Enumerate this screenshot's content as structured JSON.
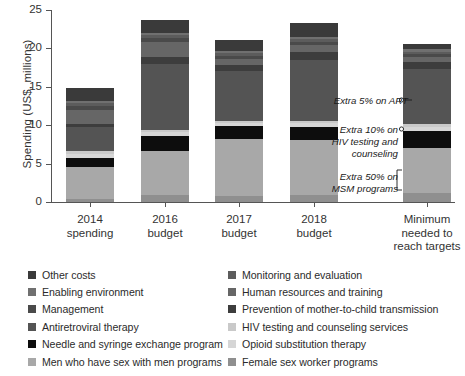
{
  "chart_data": {
    "type": "bar",
    "subtype": "stacked-bar",
    "title": "",
    "xlabel": "",
    "ylabel": "Spending (US$, millions)",
    "ylim": [
      0,
      25
    ],
    "yticks": [
      0,
      5,
      10,
      15,
      20,
      25
    ],
    "grid": false,
    "legend_position": "below",
    "categories": [
      "2014 spending",
      "2016 budget",
      "2017 budget",
      "2018 budget",
      "Minimum needed to reach targets"
    ],
    "category_lines": [
      [
        "2014",
        "spending"
      ],
      [
        "2016",
        "budget"
      ],
      [
        "2017",
        "budget"
      ],
      [
        "2018",
        "budget"
      ],
      [
        "Minimum",
        "needed to",
        "reach targets"
      ]
    ],
    "totals": [
      14.8,
      23.7,
      21.1,
      23.3,
      20.6
    ],
    "series": [
      {
        "name": "Female sex worker programs",
        "color": "#8f8f8f",
        "values": [
          0.45,
          0.95,
          0.8,
          0.85,
          1.15
        ]
      },
      {
        "name": "Men who have sex with men programs",
        "color": "#a8a8a8",
        "values": [
          4.15,
          5.65,
          7.35,
          7.2,
          5.85
        ]
      },
      {
        "name": "Needle and syringe exchange program",
        "color": "#0d0d0d",
        "values": [
          1.15,
          2.05,
          1.7,
          1.75,
          2.3
        ]
      },
      {
        "name": "Opioid substitution therapy",
        "color": "#d6d6d6",
        "values": [
          0.55,
          0.5,
          0.45,
          0.45,
          0.45
        ]
      },
      {
        "name": "HIV testing and counseling services",
        "color": "#c9c9c9",
        "values": [
          0.3,
          0.25,
          0.25,
          0.25,
          0.35
        ]
      },
      {
        "name": "Antiretroviral therapy",
        "color": "#545454",
        "values": [
          3.2,
          8.55,
          6.45,
          8.05,
          7.25
        ]
      },
      {
        "name": "Prevention of mother-to-child transmission",
        "color": "#3d3d3d",
        "values": [
          0.35,
          0.95,
          0.85,
          0.95,
          0.85
        ]
      },
      {
        "name": "Human resources and training",
        "color": "#666666",
        "values": [
          1.85,
          1.9,
          0.75,
          0.95,
          0.75
        ]
      },
      {
        "name": "Management",
        "color": "#4a4a4a",
        "values": [
          0.55,
          0.55,
          0.45,
          0.45,
          0.35
        ]
      },
      {
        "name": "Monitoring and evaluation",
        "color": "#5c5c5c",
        "values": [
          0.3,
          0.35,
          0.3,
          0.3,
          0.3
        ]
      },
      {
        "name": "Enabling environment",
        "color": "#707070",
        "values": [
          0.35,
          0.35,
          0.3,
          0.3,
          0.3
        ]
      },
      {
        "name": "Other costs",
        "color": "#3a3a3a",
        "values": [
          1.6,
          1.65,
          1.45,
          1.8,
          0.7
        ]
      }
    ],
    "annotations": [
      {
        "id": "extra-art",
        "lines": [
          "Extra 5% on ART"
        ],
        "target_value": 16.0
      },
      {
        "id": "extra-testing",
        "lines": [
          "Extra 10% on",
          "HIV testing and",
          "counseling"
        ],
        "target_value": 10.2
      },
      {
        "id": "extra-msm",
        "lines": [
          "Extra 50% on",
          "MSM programs"
        ],
        "target_value": 1.6
      }
    ]
  },
  "legend": {
    "left_column": [
      {
        "label": "Other costs",
        "color": "#3a3a3a"
      },
      {
        "label": "Enabling environment",
        "color": "#707070"
      },
      {
        "label": "Management",
        "color": "#4a4a4a"
      },
      {
        "label": "Antiretroviral therapy",
        "color": "#545454"
      },
      {
        "label": "Needle and syringe exchange program",
        "color": "#0d0d0d"
      },
      {
        "label": "Men who have sex with men programs",
        "color": "#a8a8a8"
      }
    ],
    "right_column": [
      {
        "label": "Monitoring and evaluation",
        "color": "#5c5c5c"
      },
      {
        "label": "Human resources and training",
        "color": "#666666"
      },
      {
        "label": "Prevention of mother-to-child transmission",
        "color": "#3d3d3d"
      },
      {
        "label": "HIV testing and counseling services",
        "color": "#c9c9c9"
      },
      {
        "label": "Opioid substitution therapy",
        "color": "#d6d6d6"
      },
      {
        "label": "Female sex worker programs",
        "color": "#8f8f8f"
      }
    ]
  }
}
